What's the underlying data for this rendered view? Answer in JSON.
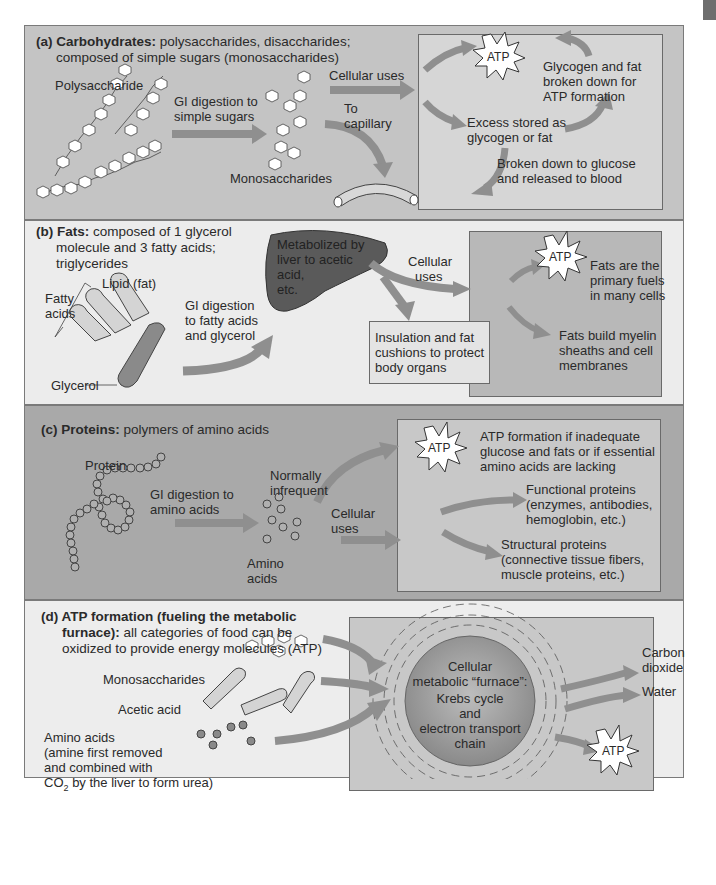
{
  "panels": {
    "a": {
      "label": "(a) Carbohydrates:",
      "desc_line1": " polysaccharides, disaccharides;",
      "desc_line2": "composed of simple sugars (monosaccharides)",
      "polysaccharide": "Polysaccharide",
      "gi_line1": "GI digestion to",
      "gi_line2": "simple sugars",
      "monosaccharides": "Monosaccharides",
      "cellular_uses": "Cellular uses",
      "to_line1": "To",
      "to_line2": "capillary",
      "atp": "ATP",
      "glycogen_line1": "Glycogen and fat",
      "glycogen_line2": "broken down for",
      "glycogen_line3": "ATP formation",
      "excess_line1": "Excess stored as",
      "excess_line2": "glycogen or fat",
      "broken_line1": "Broken down to glucose",
      "broken_line2": "and released to blood"
    },
    "b": {
      "label": "(b) Fats:",
      "desc_line1": " composed of 1 glycerol",
      "desc_line2": "molecule and 3 fatty acids;",
      "desc_line3": "triglycerides",
      "lipid": "Lipid (fat)",
      "fatty_line1": "Fatty",
      "fatty_line2": "acids",
      "glycerol": "Glycerol",
      "gi_line1": "GI digestion",
      "gi_line2": "to fatty acids",
      "gi_line3": "and glycerol",
      "liver_line1": "Metabolized by",
      "liver_line2": "liver to acetic",
      "liver_line3": "acid,",
      "liver_line4": "etc.",
      "cellular_line1": "Cellular",
      "cellular_line2": "uses",
      "insulation_line1": "Insulation and fat",
      "insulation_line2": "cushions to protect",
      "insulation_line3": "body organs",
      "atp": "ATP",
      "fuels_line1": "Fats are the",
      "fuels_line2": "primary fuels",
      "fuels_line3": "in many cells",
      "myelin_line1": "Fats build myelin",
      "myelin_line2": "sheaths and cell",
      "myelin_line3": "membranes"
    },
    "c": {
      "label": "(c) Proteins:",
      "desc_line1": " polymers of amino acids",
      "protein": "Protein",
      "gi_line1": "GI digestion to",
      "gi_line2": "amino acids",
      "amino_line1": "Amino",
      "amino_line2": "acids",
      "normally_line1": "Normally",
      "normally_line2": "infrequent",
      "cellular_line1": "Cellular",
      "cellular_line2": "uses",
      "atp": "ATP",
      "atp_line1": "ATP formation if inadequate",
      "atp_line2": "glucose and fats or if essential",
      "atp_line3": "amino acids are lacking",
      "functional_line1": "Functional proteins",
      "functional_line2": "(enzymes, antibodies,",
      "functional_line3": "hemoglobin, etc.)",
      "structural_line1": "Structural proteins",
      "structural_line2": "(connective tissue fibers,",
      "structural_line3": "muscle proteins, etc.)"
    },
    "d": {
      "label_line1": "(d) ATP formation (fueling the metabolic",
      "label_line2": "furnace):",
      "desc_line2": " all categories of food can be",
      "desc_line3": "oxidized to provide energy molecules (ATP)",
      "monosaccharides": "Monosaccharides",
      "acetic": "Acetic acid",
      "amino_line1": "Amino acids",
      "amino_line2": "(amine first removed",
      "amino_line3": "and combined with",
      "amino_line4_a": "CO",
      "amino_line4_sub": "2",
      "amino_line4_b": " by the liver to form urea)",
      "furnace_line1": "Cellular",
      "furnace_line2": "metabolic “furnace”:",
      "furnace_line3": "Krebs cycle",
      "furnace_line4": "and",
      "furnace_line5": "electron transport",
      "furnace_line6": "chain",
      "co2_line1": "Carbon",
      "co2_line2": "dioxide",
      "water": "Water",
      "atp": "ATP"
    }
  },
  "colors": {
    "panel_a": "#c4c4c4",
    "panel_b": "#ececec",
    "panel_c": "#a9a9a9",
    "panel_d": "#ededed",
    "arrow": "#8f8f8f",
    "liver": "#5a5a5a"
  }
}
